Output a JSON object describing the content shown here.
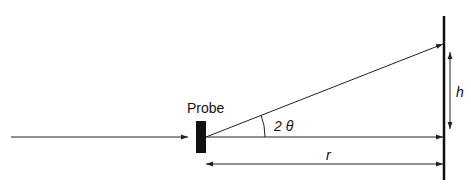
{
  "diagram": {
    "probe_label": "Probe",
    "angle_label": "2 θ",
    "height_label": "h",
    "distance_label": "r",
    "colors": {
      "line": "#222222",
      "probe": "#111111",
      "background": "#ffffff"
    }
  }
}
